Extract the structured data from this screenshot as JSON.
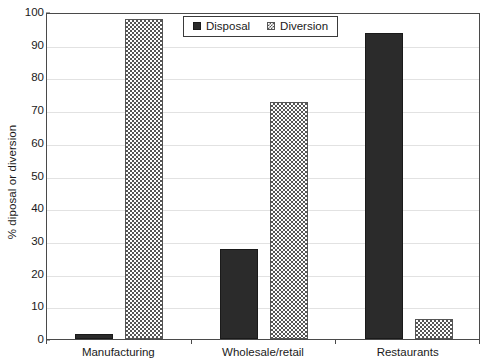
{
  "chart_data": {
    "type": "bar",
    "title": "",
    "xlabel": "",
    "ylabel": "% diposal or diversion",
    "categories": [
      "Manufacturing",
      "Wholesale/retail",
      "Restaurants"
    ],
    "series": [
      {
        "name": "Disposal",
        "values": [
          1.5,
          27.5,
          93.5
        ],
        "color": "#2b2b2b",
        "pattern": "solid"
      },
      {
        "name": "Diversion",
        "values": [
          98,
          72.5,
          6
        ],
        "color": "#555555",
        "pattern": "checkered"
      }
    ],
    "ylim": [
      0,
      100
    ],
    "ytick_step": 10,
    "yticks": [
      0,
      10,
      20,
      30,
      40,
      50,
      60,
      70,
      80,
      90,
      100
    ],
    "ytick_labels": [
      "0",
      "10",
      "20",
      "30",
      "40",
      "50",
      "60",
      "70",
      "80",
      "90",
      "100"
    ],
    "grid": true,
    "grid_axis": "y",
    "grid_color": "#e2e2e2",
    "legend_position": "top-center",
    "legend_entries": [
      "Disposal",
      "Diversion"
    ],
    "plot_border_color": "#4a4a4a",
    "background_color": "#ffffff"
  }
}
